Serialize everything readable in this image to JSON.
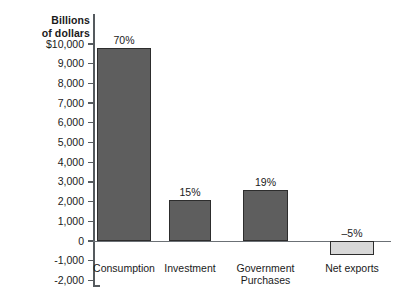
{
  "chart_data": {
    "type": "bar",
    "title": "",
    "subtitle": "",
    "xlabel": "",
    "ylabel": "Billions of dollars",
    "ylabel_line1": "Billions",
    "ylabel_line2": "of dollars",
    "categories": [
      "Consumption",
      "Investment",
      "Government Purchases",
      "Net exports"
    ],
    "category_lines": [
      [
        "Consumption"
      ],
      [
        "Investment"
      ],
      [
        "Government",
        "Purchases"
      ],
      [
        "Net exports"
      ]
    ],
    "values": [
      9800,
      2100,
      2600,
      -700
    ],
    "data_labels": [
      "70%",
      "15%",
      "19%",
      "–5%"
    ],
    "share_percent": [
      70,
      15,
      19,
      -5
    ],
    "ylim": [
      -2000,
      10000
    ],
    "ytick_values": [
      10000,
      9000,
      8000,
      7000,
      6000,
      5000,
      4000,
      3000,
      2000,
      1000,
      0,
      -1000,
      -2000
    ],
    "ytick_labels": [
      "$10,000",
      "9,000",
      "8,000",
      "7,000",
      "6,000",
      "5,000",
      "4,000",
      "3,000",
      "2,000",
      "1,000",
      "0",
      "-1,000",
      "-2,000"
    ],
    "grid": false,
    "legend": null,
    "legend_position": "none",
    "bar_colors": [
      "#5e5e5e",
      "#5e5e5e",
      "#5e5e5e",
      "#d8d8d8"
    ],
    "bar_border_color": "#2d2d2d",
    "axis_color": "#555a5e",
    "background": "#ffffff",
    "annotations": []
  }
}
